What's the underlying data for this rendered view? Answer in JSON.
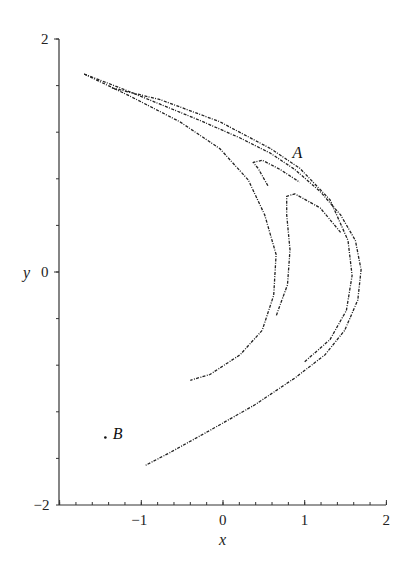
{
  "chart_data": {
    "type": "scatter",
    "title": "",
    "xlabel": "x",
    "ylabel": "y",
    "xlim": [
      -2,
      2
    ],
    "ylim": [
      -2,
      2
    ],
    "grid": false,
    "legend": null,
    "x_ticks": [
      {
        "value": -2,
        "label": "−2"
      },
      {
        "value": -1,
        "label": "−1"
      },
      {
        "value": 0,
        "label": "0"
      },
      {
        "value": 1,
        "label": "1"
      },
      {
        "value": 2,
        "label": "2"
      }
    ],
    "y_ticks": [
      {
        "value": 2,
        "label": "2"
      },
      {
        "value": 0,
        "label": "0"
      },
      {
        "value": -2,
        "label": "−2"
      }
    ],
    "x_minor_step": 0.2,
    "y_minor_step": 0.4,
    "annotations": [
      {
        "text": "A",
        "x": 0.85,
        "y": 0.98
      },
      {
        "text": "B",
        "x": -1.35,
        "y": -1.43,
        "marker": {
          "x": -1.44,
          "y": -1.42
        }
      }
    ],
    "series": [
      {
        "name": "attractor-outer-branch",
        "points": [
          [
            -1.7,
            1.7
          ],
          [
            -1.26,
            1.58
          ],
          [
            -0.77,
            1.44
          ],
          [
            -0.28,
            1.3
          ],
          [
            0.21,
            1.15
          ],
          [
            0.58,
            1.02
          ],
          [
            0.88,
            0.88
          ],
          [
            1.19,
            0.69
          ],
          [
            1.44,
            0.49
          ],
          [
            1.62,
            0.27
          ],
          [
            1.69,
            0.02
          ],
          [
            1.65,
            -0.24
          ],
          [
            1.49,
            -0.5
          ],
          [
            1.25,
            -0.71
          ],
          [
            0.88,
            -0.91
          ],
          [
            0.39,
            -1.14
          ],
          [
            -0.16,
            -1.36
          ],
          [
            -0.65,
            -1.55
          ],
          [
            -0.95,
            -1.66
          ]
        ]
      },
      {
        "name": "attractor-outer-inner-band",
        "points": [
          [
            -1.36,
            1.58
          ],
          [
            -0.77,
            1.48
          ],
          [
            -0.04,
            1.29
          ],
          [
            0.58,
            1.06
          ],
          [
            0.94,
            0.89
          ],
          [
            1.31,
            0.62
          ],
          [
            1.53,
            0.27
          ],
          [
            1.58,
            -0.03
          ],
          [
            1.51,
            -0.33
          ],
          [
            1.31,
            -0.58
          ],
          [
            1.0,
            -0.77
          ]
        ]
      },
      {
        "name": "attractor-middle-branch",
        "points": [
          [
            -1.7,
            1.7
          ],
          [
            -1.14,
            1.51
          ],
          [
            -0.53,
            1.29
          ],
          [
            -0.04,
            1.06
          ],
          [
            0.31,
            0.79
          ],
          [
            0.51,
            0.49
          ],
          [
            0.65,
            0.15
          ],
          [
            0.62,
            -0.2
          ],
          [
            0.48,
            -0.5
          ],
          [
            0.21,
            -0.71
          ],
          [
            -0.16,
            -0.88
          ],
          [
            -0.4,
            -0.93
          ]
        ]
      },
      {
        "name": "attractor-fold-a",
        "points": [
          [
            0.55,
            0.74
          ],
          [
            0.43,
            0.89
          ],
          [
            0.37,
            0.94
          ],
          [
            0.48,
            0.96
          ],
          [
            0.7,
            0.88
          ],
          [
            0.94,
            0.77
          ]
        ]
      },
      {
        "name": "attractor-inner-fold",
        "points": [
          [
            1.44,
            0.34
          ],
          [
            1.19,
            0.55
          ],
          [
            0.88,
            0.67
          ],
          [
            0.78,
            0.65
          ],
          [
            0.78,
            0.49
          ],
          [
            0.82,
            0.19
          ],
          [
            0.79,
            -0.11
          ],
          [
            0.7,
            -0.28
          ],
          [
            0.65,
            -0.38
          ]
        ]
      }
    ]
  }
}
